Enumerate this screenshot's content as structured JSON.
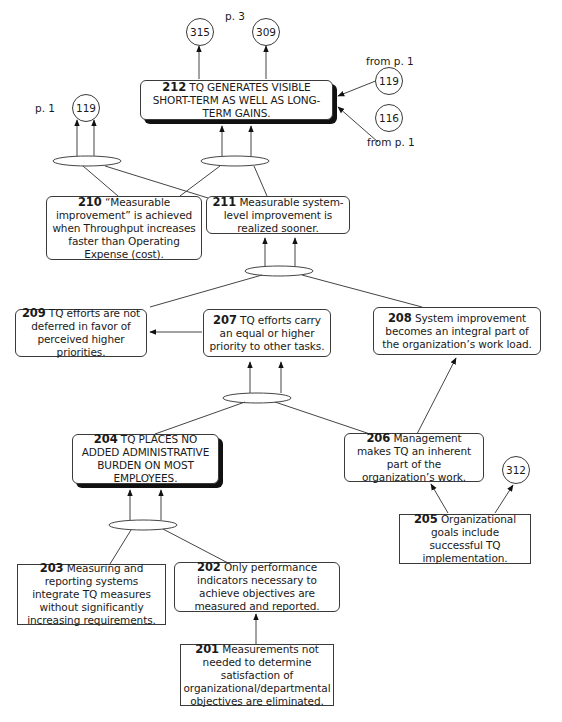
{
  "diagram": {
    "type": "current-reality-tree",
    "labels": {
      "p3": "p. 3",
      "from_p1_top": "from p. 1",
      "from_p1_bottom": "from p. 1",
      "p1_left": "p. 1"
    },
    "connectors": {
      "c315": "315",
      "c309": "309",
      "c119_right": "119",
      "c116": "116",
      "c119_left": "119",
      "c312": "312"
    },
    "nodes": {
      "n212": {
        "num": "212",
        "text": "TQ GENERATES VISIBLE SHORT-TERM AS WELL AS LONG-TERM GAINS."
      },
      "n211": {
        "num": "211",
        "text": "Measurable system-level improvement is realized sooner."
      },
      "n210": {
        "num": "210",
        "text": "“Measurable improvement” is achieved when Throughput increases faster than Operating Expense (cost)."
      },
      "n209": {
        "num": "209",
        "text": "TQ efforts are not deferred in favor of perceived higher priorities."
      },
      "n208": {
        "num": "208",
        "text": "System improvement becomes an integral part of the organization’s work load."
      },
      "n207": {
        "num": "207",
        "text": "TQ efforts carry an equal or higher priority to other tasks."
      },
      "n206": {
        "num": "206",
        "text": "Management makes TQ an inherent part of the organization’s work."
      },
      "n205": {
        "num": "205",
        "text": "Organizational goals include successful TQ implementation."
      },
      "n204": {
        "num": "204",
        "text": "TQ PLACES NO ADDED ADMINISTRATIVE BURDEN ON MOST EMPLOYEES."
      },
      "n203": {
        "num": "203",
        "text": "Measuring and reporting systems integrate TQ measures without significantly increasing requirements."
      },
      "n202": {
        "num": "202",
        "text": "Only performance indicators necessary to achieve objectives are measured and reported."
      },
      "n201": {
        "num": "201",
        "text": "Measurements not needed to determine satisfaction of organizational/departmental objectives are eliminated."
      }
    },
    "edges": [
      {
        "from": "212",
        "to": "315"
      },
      {
        "from": "212",
        "to": "309"
      },
      {
        "from": "119",
        "to": "212"
      },
      {
        "from": "116",
        "to": "212"
      },
      {
        "from": [
          "210",
          "211"
        ],
        "to": "119",
        "and": true
      },
      {
        "from": [
          "210",
          "211"
        ],
        "to": "212",
        "and": true
      },
      {
        "from": [
          "209",
          "208"
        ],
        "to": "211",
        "and": true
      },
      {
        "from": "207",
        "to": "209"
      },
      {
        "from": [
          "204",
          "206"
        ],
        "to": "207",
        "and": true
      },
      {
        "from": "206",
        "to": "208"
      },
      {
        "from": "205",
        "to": "206"
      },
      {
        "from": "205",
        "to": "312"
      },
      {
        "from": [
          "203",
          "202"
        ],
        "to": "204",
        "and": true
      },
      {
        "from": "201",
        "to": "202"
      }
    ]
  }
}
